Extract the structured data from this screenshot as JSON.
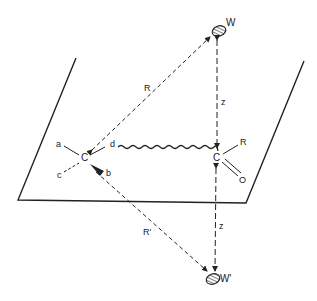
{
  "diagram": {
    "labels": {
      "water_top": "W",
      "water_bottom": "W'",
      "carbon_left": "C",
      "carbon_right": "C",
      "sub_a": "a",
      "sub_b": "b",
      "sub_c": "c",
      "sub_d": "d",
      "sub_R": "R",
      "oxygen": "O",
      "dist_R": "R",
      "dist_R_prime": "R'",
      "dist_z_top": "z",
      "dist_z_bottom": "z"
    },
    "colors": {
      "line": "#222222",
      "background": "#ffffff"
    }
  }
}
